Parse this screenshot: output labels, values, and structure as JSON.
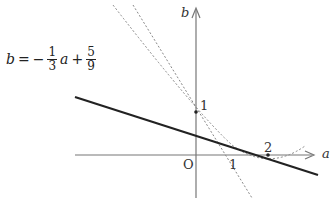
{
  "diagram": {
    "axes": {
      "x_label": "a",
      "y_label": "b",
      "origin_label": "O"
    },
    "tick_labels": {
      "b_one": "1",
      "a_one": "1",
      "a_two": "2"
    },
    "equation": {
      "lhs": "b",
      "equals": "=",
      "sign": "−",
      "frac1_num": "1",
      "frac1_den": "3",
      "var": "a",
      "plus": "+",
      "frac2_num": "5",
      "frac2_den": "9"
    },
    "curves": [
      {
        "name": "line b = -1/3 a + 5/9",
        "style": "solid-thick"
      },
      {
        "name": "tangent line",
        "style": "dashed"
      },
      {
        "name": "parabola",
        "style": "dashed"
      }
    ],
    "points": [
      {
        "label": "1",
        "coords": [
          0,
          1
        ]
      },
      {
        "label": "2",
        "coords": [
          2,
          0
        ]
      }
    ]
  }
}
